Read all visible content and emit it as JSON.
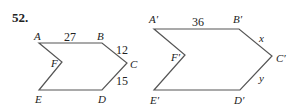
{
  "problem": {
    "number": "52."
  },
  "figure_left": {
    "vertices": {
      "A": "A",
      "B": "B",
      "C": "C",
      "D": "D",
      "E": "E",
      "F": "F"
    },
    "sides": {
      "AB": "27",
      "BC": "12",
      "CD": "15"
    }
  },
  "figure_right": {
    "vertices": {
      "A": "A′",
      "B": "B′",
      "C": "C′",
      "D": "D′",
      "E": "E′",
      "F": "F′"
    },
    "sides": {
      "AB": "36",
      "BC": "x",
      "CD": "y"
    }
  },
  "colors": {
    "stroke": "#555555",
    "text": "#222222"
  }
}
